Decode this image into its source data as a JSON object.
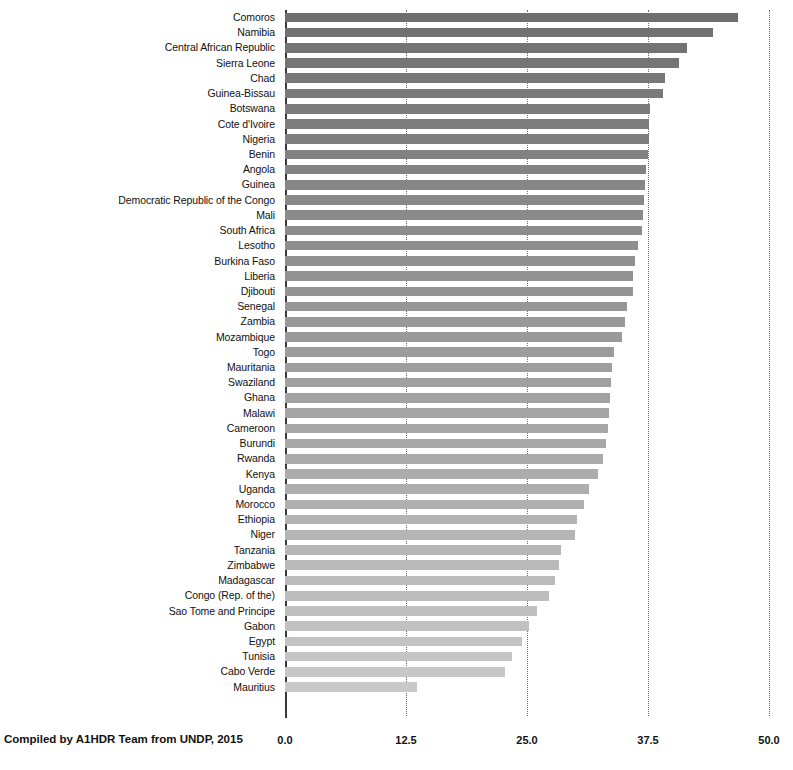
{
  "chart_data": {
    "type": "bar",
    "orientation": "horizontal",
    "title": "",
    "subtitle": "",
    "xlabel": "",
    "ylabel": "",
    "xlim": [
      0.0,
      50.0
    ],
    "xticks": [
      0.0,
      12.5,
      25.0,
      37.5,
      50.0
    ],
    "xtick_labels": [
      "0.0",
      "12.5",
      "25.0",
      "37.5",
      "50.0"
    ],
    "grid": true,
    "grid_axis": "x",
    "legend": false,
    "legend_position": "none",
    "bar_color_start": "#6f6f6f",
    "bar_color_end": "#c9c9c9",
    "axis_color": "#3a3a3a",
    "gridline_color": "#6b6b6b",
    "categories": [
      "Comoros",
      "Namibia",
      "Central African Republic",
      "Sierra Leone",
      "Chad",
      "Guinea-Bissau",
      "Botswana",
      "Cote d'Ivoire",
      "Nigeria",
      "Benin",
      "Angola",
      "Guinea",
      "Democratic Republic of the Congo",
      "Mali",
      "South Africa",
      "Lesotho",
      "Burkina Faso",
      "Liberia",
      "Djibouti",
      "Senegal",
      "Zambia",
      "Mozambique",
      "Togo",
      "Mauritania",
      "Swaziland",
      "Ghana",
      "Malawi",
      "Cameroon",
      "Burundi",
      "Rwanda",
      "Kenya",
      "Uganda",
      "Morocco",
      "Ethiopia",
      "Niger",
      "Tanzania",
      "Zimbabwe",
      "Madagascar",
      "Congo (Rep. of the)",
      "Sao Tome and Principe",
      "Gabon",
      "Egypt",
      "Tunisia",
      "Cabo Verde",
      "Mauritius"
    ],
    "values": [
      46.8,
      44.2,
      41.5,
      40.7,
      39.3,
      39.0,
      37.7,
      37.6,
      37.6,
      37.5,
      37.3,
      37.2,
      37.1,
      37.0,
      36.9,
      36.5,
      36.2,
      36.0,
      35.9,
      35.3,
      35.1,
      34.8,
      34.0,
      33.8,
      33.7,
      33.6,
      33.5,
      33.4,
      33.2,
      32.8,
      32.3,
      31.4,
      30.9,
      30.2,
      30.0,
      28.5,
      28.3,
      27.9,
      27.3,
      26.0,
      25.2,
      24.5,
      23.5,
      22.7,
      13.6
    ]
  },
  "footnote": {
    "text": "Compiled by A1HDR Team from UNDP, 2015"
  }
}
